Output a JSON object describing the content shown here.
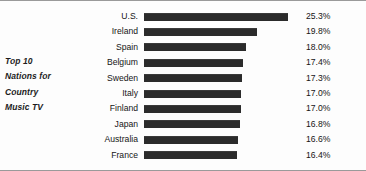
{
  "title_lines": [
    "Top 10",
    "Nations for",
    "Country",
    "Music TV"
  ],
  "colors": {
    "bar": "#2b2b2b",
    "text": "#151515",
    "background": "#fdfdfd",
    "border": "#9a9a9a"
  },
  "chart_data": {
    "type": "bar",
    "title": "Top 10 Nations for Country Music TV",
    "orientation": "horizontal",
    "xlabel": "",
    "ylabel": "",
    "grid": false,
    "legend": false,
    "value_suffix": "%",
    "xlim": [
      0,
      25.3
    ],
    "categories": [
      "U.S.",
      "Ireland",
      "Spain",
      "Belgium",
      "Sweden",
      "Italy",
      "Finland",
      "Japan",
      "Australia",
      "France"
    ],
    "values": [
      25.3,
      19.8,
      18.0,
      17.4,
      17.3,
      17.0,
      17.0,
      16.8,
      16.6,
      16.4
    ],
    "value_labels": [
      "25.3%",
      "19.8%",
      "18.0%",
      "17.4%",
      "17.3%",
      "17.0%",
      "17.0%",
      "16.8%",
      "16.6%",
      "16.4%"
    ]
  }
}
